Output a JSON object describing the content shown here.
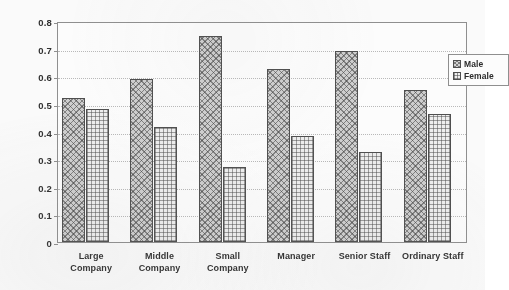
{
  "chart_data": {
    "type": "bar",
    "title": "",
    "xlabel": "",
    "ylabel": "",
    "ylim": [
      0,
      0.8
    ],
    "ytick_labels": [
      "0.8",
      "0.7",
      "0.6",
      "0.5",
      "0.4",
      "0.3",
      "0.2",
      "0.1",
      "0"
    ],
    "ytick_values": [
      0.8,
      0.7,
      0.6,
      0.5,
      0.4,
      0.3,
      0.2,
      0.1,
      0
    ],
    "grid": true,
    "legend_position": "top-right-inside",
    "categories": [
      "Large Company",
      "Middle Company",
      "Small Company",
      "Manager",
      "Senior Staff",
      "Ordinary Staff"
    ],
    "category_lines": [
      [
        "Large",
        "Company"
      ],
      [
        "Middle",
        "Company"
      ],
      [
        "Small",
        "Company"
      ],
      [
        "Manager"
      ],
      [
        "Senior Staff"
      ],
      [
        "Ordinary Staff"
      ]
    ],
    "series": [
      {
        "name": "Male",
        "pattern": "diagonal-crosshatch",
        "values": [
          0.52,
          0.59,
          0.745,
          0.625,
          0.69,
          0.55
        ]
      },
      {
        "name": "Female",
        "pattern": "grid-hatch",
        "values": [
          0.48,
          0.415,
          0.27,
          0.385,
          0.325,
          0.465
        ]
      }
    ]
  },
  "legend": {
    "items": [
      {
        "label": "Male",
        "swatch": "male-pattern-swatch"
      },
      {
        "label": "Female",
        "swatch": "female-pattern-swatch"
      }
    ]
  },
  "colors": {
    "axis": "#8d8d8d",
    "gridline": "#b9b9b9",
    "bar_outline": "#4a4a4a",
    "text": "#2b2b2b",
    "background": "#ffffff"
  }
}
